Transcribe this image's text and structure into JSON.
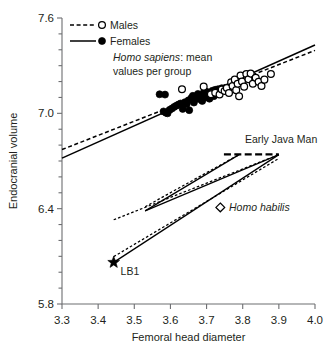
{
  "chart_data": {
    "type": "scatter",
    "title": "",
    "xlabel": "Femoral head diameter",
    "ylabel": "Endocranial volume",
    "xlim": [
      3.3,
      4.0
    ],
    "ylim": [
      5.8,
      7.6
    ],
    "xticks": [
      3.3,
      3.4,
      3.5,
      3.6,
      3.7,
      3.8,
      3.9,
      4.0
    ],
    "xticklabels": [
      "3.3",
      "3.4",
      "3.5",
      "3.6",
      "3.7",
      "3.8",
      "3.9",
      "4.0"
    ],
    "yticks": [
      5.8,
      6.4,
      7.0,
      7.6
    ],
    "yticklabels": [
      "5.8",
      "6.4",
      "7.0",
      "7.6"
    ],
    "y_minor_ticks": [
      5.9,
      6.0,
      6.1,
      6.2,
      6.3,
      6.5,
      6.6,
      6.7,
      6.8,
      6.9,
      7.1,
      7.2,
      7.3,
      7.4,
      7.5
    ],
    "grid": false,
    "legend_position": "top-left",
    "legend": [
      {
        "name": "Males",
        "marker": "open-circle",
        "line": "dashed"
      },
      {
        "name": "Females",
        "marker": "filled-circle",
        "line": "solid"
      }
    ],
    "caption_italic": "Homo sapiens",
    "caption_rest": ": mean",
    "caption_line2": "values per group",
    "series": [
      {
        "name": "Females",
        "marker": "filled-circle",
        "points": [
          [
            3.57,
            7.12
          ],
          [
            3.585,
            7.118
          ],
          [
            3.581,
            7.012
          ],
          [
            3.588,
            7.003
          ],
          [
            3.592,
            7.0
          ],
          [
            3.598,
            7.022
          ],
          [
            3.604,
            7.03
          ],
          [
            3.61,
            7.04
          ],
          [
            3.616,
            7.048
          ],
          [
            3.622,
            7.055
          ],
          [
            3.628,
            7.062
          ],
          [
            3.634,
            7.028
          ],
          [
            3.64,
            7.07
          ],
          [
            3.645,
            7.058
          ],
          [
            3.65,
            7.082
          ],
          [
            3.652,
            7.02
          ],
          [
            3.658,
            7.096
          ],
          [
            3.662,
            7.11
          ],
          [
            3.665,
            7.068
          ],
          [
            3.67,
            7.105
          ],
          [
            3.676,
            7.122
          ],
          [
            3.68,
            7.09
          ],
          [
            3.684,
            7.112
          ],
          [
            3.688,
            7.078
          ],
          [
            3.692,
            7.13
          ],
          [
            3.696,
            7.1
          ],
          [
            3.7,
            7.136
          ],
          [
            3.704,
            7.118
          ],
          [
            3.708,
            7.092
          ],
          [
            3.712,
            7.128
          ],
          [
            3.716,
            7.142
          ],
          [
            3.72,
            7.108
          ],
          [
            3.724,
            7.148
          ],
          [
            3.728,
            7.126
          ],
          [
            3.732,
            7.152
          ],
          [
            3.738,
            7.14
          ],
          [
            3.742,
            7.158
          ],
          [
            3.748,
            7.146
          ],
          [
            3.752,
            7.16
          ],
          [
            3.758,
            7.15
          ]
        ]
      },
      {
        "name": "Males",
        "marker": "open-circle",
        "points": [
          [
            3.632,
            7.152
          ],
          [
            3.692,
            7.168
          ],
          [
            3.712,
            7.12
          ],
          [
            3.724,
            7.13
          ],
          [
            3.736,
            7.118
          ],
          [
            3.742,
            7.15
          ],
          [
            3.75,
            7.14
          ],
          [
            3.756,
            7.16
          ],
          [
            3.762,
            7.128
          ],
          [
            3.768,
            7.196
          ],
          [
            3.772,
            7.172
          ],
          [
            3.778,
            7.212
          ],
          [
            3.782,
            7.146
          ],
          [
            3.786,
            7.186
          ],
          [
            3.79,
            7.108
          ],
          [
            3.794,
            7.238
          ],
          [
            3.798,
            7.2
          ],
          [
            3.804,
            7.168
          ],
          [
            3.81,
            7.248
          ],
          [
            3.816,
            7.214
          ],
          [
            3.822,
            7.25
          ],
          [
            3.828,
            7.186
          ],
          [
            3.836,
            7.224
          ],
          [
            3.844,
            7.198
          ],
          [
            3.852,
            7.172
          ],
          [
            3.86,
            7.212
          ],
          [
            3.878,
            7.248
          ]
        ]
      }
    ],
    "regression_lines": [
      {
        "name": "Males",
        "style": "dashed",
        "x": [
          3.3,
          4.0
        ],
        "y": [
          6.772,
          7.396
        ]
      },
      {
        "name": "Females",
        "style": "solid",
        "x": [
          3.3,
          4.0
        ],
        "y": [
          6.718,
          7.43
        ]
      }
    ],
    "fossil_lines": [
      {
        "name": "upper-males",
        "style": "dashed",
        "x": [
          3.53,
          3.79
        ],
        "y": [
          6.412,
          6.74
        ]
      },
      {
        "name": "upper-females",
        "style": "solid",
        "x": [
          3.53,
          3.79
        ],
        "y": [
          6.386,
          6.74
        ]
      },
      {
        "name": "lower-males",
        "style": "dashed",
        "x": [
          3.443,
          3.9
        ],
        "y": [
          6.33,
          6.74
        ]
      },
      {
        "name": "lower-females",
        "style": "solid",
        "x": [
          3.443,
          3.9
        ],
        "y": [
          6.062,
          6.74
        ]
      },
      {
        "name": "lower-males-2",
        "style": "dashed",
        "x": [
          3.443,
          3.9
        ],
        "y": [
          6.098,
          6.716
        ]
      },
      {
        "name": "upper-to-java",
        "style": "solid",
        "x": [
          3.53,
          3.9
        ],
        "y": [
          6.386,
          6.74
        ]
      }
    ],
    "java_segment": {
      "x": [
        3.748,
        3.9
      ],
      "y": [
        6.742,
        6.742
      ]
    },
    "annotations": [
      {
        "name": "Early Java Man",
        "x": 3.806,
        "y": 6.84,
        "italic": false
      },
      {
        "name": "Homo habilis",
        "x": 3.762,
        "y": 6.408,
        "italic": true,
        "marker": "open-diamond",
        "marker_x": 3.738,
        "marker_y": 6.408
      },
      {
        "name": "LB1",
        "x": 3.462,
        "y": 6.01,
        "italic": false,
        "marker": "star",
        "marker_x": 3.443,
        "marker_y": 6.062
      }
    ]
  }
}
